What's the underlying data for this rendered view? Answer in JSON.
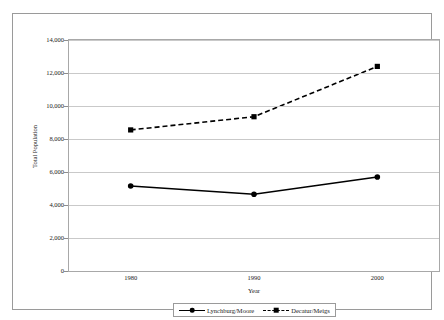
{
  "chart_data": {
    "type": "line",
    "title": "",
    "xlabel": "Year",
    "ylabel": "Total Population",
    "categories": [
      "1980",
      "1990",
      "2000"
    ],
    "x": [
      1980,
      1990,
      2000
    ],
    "series": [
      {
        "name": "Lynchburg/Moore",
        "values": [
          5150,
          4650,
          5700
        ],
        "line_style": "solid",
        "marker": "circle",
        "color": "#000000"
      },
      {
        "name": "Decatur/Meigs",
        "values": [
          8550,
          9350,
          12400
        ],
        "line_style": "dashed",
        "marker": "square",
        "color": "#000000"
      }
    ],
    "ylim": [
      0,
      14000
    ],
    "ytick_values": [
      0,
      2000,
      4000,
      6000,
      8000,
      10000,
      12000,
      14000
    ],
    "ytick_labels": [
      "0",
      "2,000",
      "4,000",
      "6,000",
      "8,000",
      "10,000",
      "12,000",
      "14,000"
    ],
    "xtick_labels": [
      "1980",
      "1990",
      "2000"
    ],
    "grid": "horizontal",
    "legend_position": "bottom-center",
    "frame": true,
    "colors": {
      "line": "#000000",
      "grid": "#c9c9c9",
      "axis": "#a8a8a8",
      "frame": "#9a9a9a",
      "text": "#1a1a1a",
      "background": "#ffffff"
    }
  }
}
